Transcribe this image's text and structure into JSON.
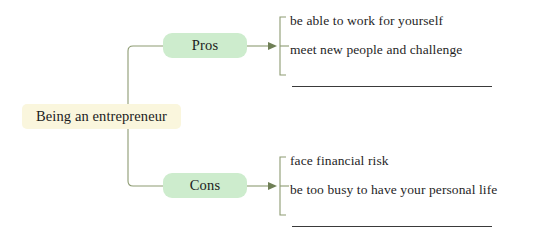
{
  "diagram": {
    "type": "tree-mindmap",
    "root": {
      "label": "Being an entrepreneur",
      "color": "#faf6dd"
    },
    "branches": [
      {
        "label": "Pros",
        "color": "#cdeccd",
        "items": [
          {
            "text": "be able to work for yourself",
            "blank": false
          },
          {
            "text": "meet new people and challenge",
            "blank": false
          },
          {
            "text": "",
            "blank": true
          }
        ]
      },
      {
        "label": "Cons",
        "color": "#cdeccd",
        "items": [
          {
            "text": "face financial risk",
            "blank": false
          },
          {
            "text": "be too busy to have your personal life",
            "blank": false
          },
          {
            "text": "",
            "blank": true
          }
        ]
      }
    ],
    "connector_color": "#8d9b72",
    "background": "#ffffff"
  }
}
